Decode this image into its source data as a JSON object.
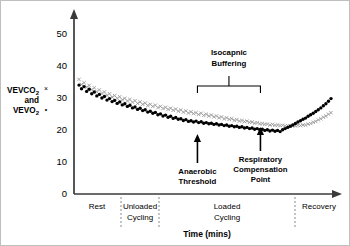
{
  "chart_data": {
    "type": "scatter",
    "title": "",
    "xlabel": "Time (mins)",
    "ylabel_lines": [
      "VEVCO",
      "and",
      "VEVO"
    ],
    "ylabel_full": "VEVCO2 × and VEVO2 •",
    "ylim": [
      0,
      55
    ],
    "yticks": [
      0,
      10,
      20,
      30,
      40,
      50
    ],
    "ytick_labels": [
      "0",
      "10",
      "20",
      "30",
      "40",
      "50"
    ],
    "grid": false,
    "legend_position": "y-axis-label",
    "series": [
      {
        "name": "VEVCO2",
        "marker": "x",
        "color": "#9a9a9a",
        "x": [
          0,
          1,
          2,
          3,
          4,
          5,
          6,
          7,
          8,
          9,
          10,
          11,
          12,
          13,
          14,
          15,
          16,
          17,
          18,
          19,
          20,
          21,
          22,
          23,
          24,
          25,
          26,
          27,
          28,
          29,
          30,
          31,
          32,
          33,
          34,
          35,
          36,
          37,
          38,
          39,
          40,
          41,
          42,
          43,
          44,
          45,
          46,
          47,
          48,
          49,
          50,
          51,
          52,
          53,
          54,
          55,
          56,
          57,
          58,
          59,
          60,
          61,
          62,
          63,
          64,
          65,
          66,
          67,
          68,
          69,
          70,
          71,
          72,
          73,
          74,
          75,
          76,
          77,
          78,
          79,
          80,
          81,
          82,
          83,
          84,
          85,
          86,
          87,
          88,
          89,
          90,
          91,
          92,
          93,
          94,
          95,
          96,
          97,
          98,
          99
        ],
        "values": [
          38.2,
          36.5,
          37.1,
          35.6,
          36.2,
          34.8,
          35.4,
          34.1,
          34.7,
          33.5,
          34.0,
          32.9,
          33.4,
          32.3,
          32.8,
          31.9,
          32.4,
          31.4,
          31.9,
          31.0,
          31.5,
          30.6,
          31.1,
          30.2,
          30.7,
          29.9,
          30.3,
          29.5,
          29.9,
          29.2,
          29.6,
          28.8,
          29.2,
          28.5,
          28.9,
          28.2,
          28.6,
          27.9,
          28.3,
          27.6,
          28.0,
          27.3,
          27.7,
          27.0,
          27.4,
          26.8,
          27.1,
          26.5,
          26.9,
          26.2,
          26.6,
          26.0,
          26.3,
          25.7,
          26.0,
          25.4,
          25.7,
          25.1,
          25.4,
          24.9,
          25.1,
          24.6,
          24.8,
          24.3,
          24.5,
          24.1,
          24.3,
          23.9,
          24.0,
          23.6,
          23.8,
          23.4,
          23.5,
          23.2,
          23.3,
          23.0,
          23.2,
          22.9,
          23.0,
          22.8,
          22.9,
          22.7,
          22.8,
          22.6,
          22.8,
          22.7,
          22.9,
          22.8,
          23.0,
          23.0,
          23.3,
          23.5,
          23.9,
          24.2,
          24.7,
          25.1,
          25.6,
          26.0,
          26.6,
          27.1
        ]
      },
      {
        "name": "VEVO2",
        "marker": "dot",
        "color": "#000000",
        "x": [
          0,
          1,
          2,
          3,
          4,
          5,
          6,
          7,
          8,
          9,
          10,
          11,
          12,
          13,
          14,
          15,
          16,
          17,
          18,
          19,
          20,
          21,
          22,
          23,
          24,
          25,
          26,
          27,
          28,
          29,
          30,
          31,
          32,
          33,
          34,
          35,
          36,
          37,
          38,
          39,
          40,
          41,
          42,
          43,
          44,
          45,
          46,
          47,
          48,
          49,
          50,
          51,
          52,
          53,
          54,
          55,
          56,
          57,
          58,
          59,
          60,
          61,
          62,
          63,
          64,
          65,
          66,
          67,
          68,
          69,
          70,
          71,
          72,
          73,
          74,
          75,
          76,
          77,
          78,
          79,
          80,
          81,
          82,
          83,
          84,
          85,
          86,
          87,
          88,
          89,
          90,
          91,
          92,
          93,
          94,
          95,
          96,
          97,
          98,
          99
        ],
        "values": [
          36.3,
          35.1,
          35.8,
          34.2,
          34.9,
          33.4,
          34.0,
          32.7,
          33.2,
          32.0,
          32.5,
          31.3,
          31.8,
          30.8,
          31.2,
          30.2,
          30.7,
          29.7,
          30.1,
          29.2,
          29.6,
          28.7,
          29.0,
          28.2,
          28.6,
          27.8,
          28.1,
          27.3,
          27.6,
          26.9,
          27.2,
          26.4,
          26.7,
          26.0,
          26.3,
          25.6,
          25.9,
          25.2,
          25.5,
          24.9,
          25.1,
          24.5,
          24.8,
          24.2,
          24.4,
          24.0,
          24.3,
          23.8,
          24.1,
          23.6,
          23.8,
          23.4,
          23.6,
          23.2,
          23.4,
          23.0,
          23.2,
          22.8,
          23.0,
          22.6,
          22.8,
          22.4,
          22.6,
          22.2,
          22.4,
          22.0,
          22.2,
          21.8,
          22.0,
          21.6,
          21.8,
          21.4,
          21.6,
          21.2,
          21.4,
          21.0,
          21.3,
          20.9,
          21.2,
          20.8,
          21.4,
          21.8,
          22.2,
          22.6,
          23.0,
          23.5,
          24.0,
          24.4,
          24.9,
          25.3,
          25.9,
          26.4,
          26.9,
          27.5,
          28.1,
          28.7,
          29.4,
          30.1,
          30.9,
          31.8
        ]
      }
    ],
    "phases": [
      {
        "label_lines": [
          "Rest"
        ],
        "start_pct": 0,
        "end_pct": 18
      },
      {
        "label_lines": [
          "Unloaded",
          "Cycling"
        ],
        "start_pct": 18,
        "end_pct": 32
      },
      {
        "label_lines": [
          "Loaded",
          "Cycling"
        ],
        "start_pct": 32,
        "end_pct": 82
      },
      {
        "label_lines": [
          "Recovery"
        ],
        "start_pct": 82,
        "end_pct": 100
      }
    ],
    "annotations": [
      {
        "name": "anaerobic-threshold",
        "label_lines": [
          "Anaerobic",
          "Threshold"
        ],
        "x_pct": 47,
        "type": "arrow-up"
      },
      {
        "name": "respiratory-compensation-point",
        "label_lines": [
          "Respiratory",
          "Compensation",
          "Point"
        ],
        "x_pct": 72,
        "type": "arrow-up"
      },
      {
        "name": "isocapnic-buffering",
        "label_lines": [
          "Isocapnic",
          "Buffering"
        ],
        "x_start_pct": 47,
        "x_end_pct": 72,
        "type": "brace"
      }
    ]
  },
  "axis": {
    "y_tick_0": "0",
    "y_tick_10": "10",
    "y_tick_20": "20",
    "y_tick_30": "30",
    "y_tick_40": "40",
    "y_tick_50": "50",
    "x_title": "Time (mins)"
  },
  "ylabel": {
    "line1_main": "VEVCO",
    "line1_sub": "2",
    "line1_marker": "×",
    "line2": "and",
    "line3_main": "VEVO",
    "line3_sub": "2",
    "line3_marker": "•"
  },
  "phase_labels": {
    "rest": "Rest",
    "unloaded_1": "Unloaded",
    "unloaded_2": "Cycling",
    "loaded_1": "Loaded",
    "loaded_2": "Cycling",
    "recovery": "Recovery"
  },
  "annotations_text": {
    "isocapnic_1": "Isocapnic",
    "isocapnic_2": "Buffering",
    "anaerobic_1": "Anaerobic",
    "anaerobic_2": "Threshold",
    "respiratory_1": "Respiratory",
    "respiratory_2": "Compensation",
    "respiratory_3": "Point"
  },
  "colors": {
    "vevco2_marker": "#9a9a9a",
    "vevo2_marker": "#000000",
    "axis": "#3a3a3a",
    "divider": "#8a8a8a",
    "background": "#ffffff"
  }
}
